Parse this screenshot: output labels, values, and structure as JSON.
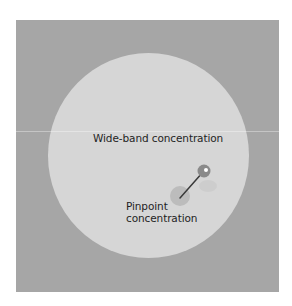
{
  "diagram": {
    "labels": {
      "wide_band": "Wide-band concentration",
      "pinpoint_line1": "Pinpoint",
      "pinpoint_line2": "concentration"
    },
    "colors": {
      "panel": "#a6a6a6",
      "wide_zone": "#d6d6d6",
      "pin_head": "#8a8a8a",
      "pin_shaft": "#3a3a3a",
      "pin_spot": "#bcbcbc",
      "text": "#1f1f1f"
    },
    "icons": {
      "pin": "map-pin-icon"
    }
  }
}
